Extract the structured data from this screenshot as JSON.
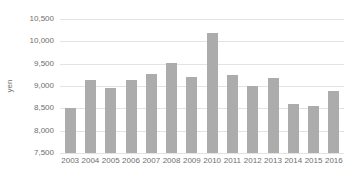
{
  "chart_data": {
    "type": "bar",
    "title": "",
    "categories": [
      "2003",
      "2004",
      "2005",
      "2006",
      "2007",
      "2008",
      "2009",
      "2010",
      "2011",
      "2012",
      "2013",
      "2014",
      "2015",
      "2016"
    ],
    "values": [
      8500,
      9130,
      8950,
      9130,
      9270,
      9520,
      9210,
      10180,
      9240,
      8990,
      9170,
      8590,
      8560,
      8890
    ],
    "xlabel": "",
    "ylabel": "yen",
    "ylim": [
      7500,
      10500
    ],
    "ytick_step": 500,
    "ytick_labels": [
      "7,500",
      "8,000",
      "8,500",
      "9,000",
      "9,500",
      "10,000",
      "10,500"
    ],
    "grid": true,
    "legend": false,
    "legend_position": "none"
  },
  "colors": {
    "bar_fill": "#acacac",
    "gridline": "#e3e3e3",
    "axis_text": "#6e6e6e",
    "background": "#ffffff"
  }
}
